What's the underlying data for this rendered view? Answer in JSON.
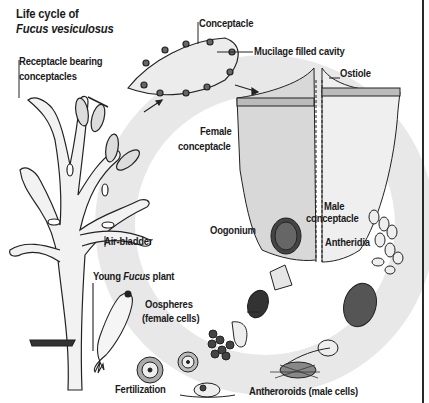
{
  "title": {
    "line1": "Life cycle of",
    "line2": "Fucus vesiculosus"
  },
  "labels": {
    "receptacle_line1": "Receptacle bearing",
    "receptacle_line2": "conceptacles",
    "conceptacle": "Conceptacle",
    "mucilage": "Mucilage filled cavity",
    "ostiole": "Ostiole",
    "female_line1": "Female",
    "female_line2": "conceptacle",
    "male_line1": "Male",
    "male_line2": "conceptacle",
    "antheridia": "Antheridia",
    "oogonium": "Oogonium",
    "air_bladder": "Air-bladder",
    "young_prefix": "Young ",
    "young_italic": "Fucus",
    "young_suffix": " plant",
    "oospheres_line1": "Oospheres",
    "oospheres_line2": "(female cells)",
    "fertilization": "Fertilization",
    "antherozoids": "Antheroroids (male cells)"
  },
  "colors": {
    "ink": "#1a1a1a",
    "cycle_ring": "#e6e6e6",
    "background": "#ffffff"
  }
}
